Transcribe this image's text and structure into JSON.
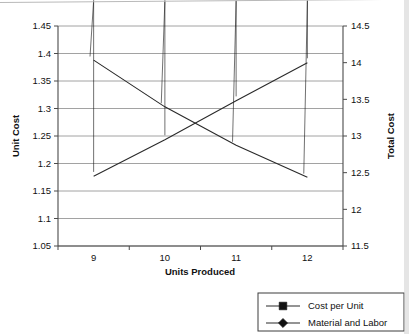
{
  "chart_data": {
    "type": "line",
    "title": "",
    "xlabel": "Units Produced",
    "ylabel": "Unit Cost",
    "y2label": "Total Cost",
    "categories": [
      "9",
      "10",
      "11",
      "12"
    ],
    "x": [
      9,
      10,
      11,
      12
    ],
    "ylim": [
      1.05,
      1.45
    ],
    "y2lim": [
      11.5,
      14.5
    ],
    "yticks": [
      "1.05",
      "1.1",
      "1.15",
      "1.2",
      "1.25",
      "1.3",
      "1.35",
      "1.4",
      "1.45"
    ],
    "ytick_values": [
      1.05,
      1.1,
      1.15,
      1.2,
      1.25,
      1.3,
      1.35,
      1.4,
      1.45
    ],
    "y2ticks": [
      "11.5",
      "12",
      "12.5",
      "13",
      "13.5",
      "14",
      "14.5"
    ],
    "y2tick_values": [
      11.5,
      12,
      12.5,
      13,
      13.5,
      14,
      14.5
    ],
    "grid": true,
    "legend_position": "bottom-right",
    "series": [
      {
        "name": "Cost per Unit",
        "axis": "left",
        "marker": "square",
        "values": [
          1.388,
          1.303,
          1.233,
          1.175
        ]
      },
      {
        "name": "Material and Labor",
        "axis": "right",
        "marker": "diamond",
        "values": [
          12.45,
          12.95,
          13.48,
          14.0
        ]
      }
    ]
  },
  "axes": {
    "left_title": "Unit Cost",
    "right_title": "Total Cost",
    "bottom_title": "Units Produced"
  },
  "legend": {
    "entries": [
      {
        "label": "Cost per Unit",
        "marker": "square"
      },
      {
        "label": "Material and Labor",
        "marker": "diamond"
      }
    ]
  },
  "colors": {
    "line": "#2a2a2a",
    "marker": "#111111",
    "grid": "#8a8a8a",
    "axis": "#4a4a4a",
    "background": "#ffffff"
  }
}
